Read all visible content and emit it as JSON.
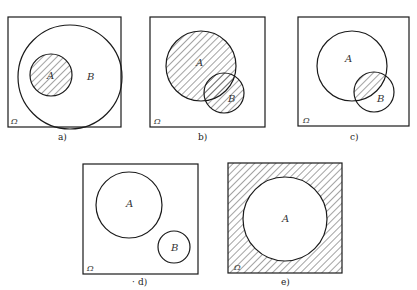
{
  "figure": {
    "universe_label": "Ω",
    "colors": {
      "stroke": "#1a1a1a",
      "hatch": "#333333",
      "background": "#ffffff"
    },
    "panels": [
      {
        "id": "a",
        "caption": "a)",
        "sets": [
          "A",
          "B"
        ],
        "relation": "A subset of B",
        "shaded": "A"
      },
      {
        "id": "b",
        "caption": "b)",
        "sets": [
          "A",
          "B"
        ],
        "relation": "A and B overlap",
        "shaded": "A ∪ B"
      },
      {
        "id": "c",
        "caption": "c)",
        "sets": [
          "A",
          "B"
        ],
        "relation": "A and B overlap",
        "shaded": "A ∩ B"
      },
      {
        "id": "d",
        "caption": "d)",
        "sets": [
          "A",
          "B"
        ],
        "relation": "A and B disjoint",
        "shaded": "none"
      },
      {
        "id": "e",
        "caption": "e)",
        "sets": [
          "A"
        ],
        "relation": "A within Ω",
        "shaded": "complement of A"
      }
    ]
  },
  "labels": {
    "a": {
      "A": "A",
      "B": "B",
      "omega": "Ω",
      "caption": "a)"
    },
    "b": {
      "A": "A",
      "B": "B",
      "omega": "Ω",
      "caption": "b)"
    },
    "c": {
      "A": "A",
      "B": "B",
      "omega": "Ω",
      "caption": "c)"
    },
    "d": {
      "A": "A",
      "B": "B",
      "omega": "Ω",
      "caption": "d)",
      "prefix": "·"
    },
    "e": {
      "A": "A",
      "omega": "Ω",
      "caption": "e)"
    }
  }
}
